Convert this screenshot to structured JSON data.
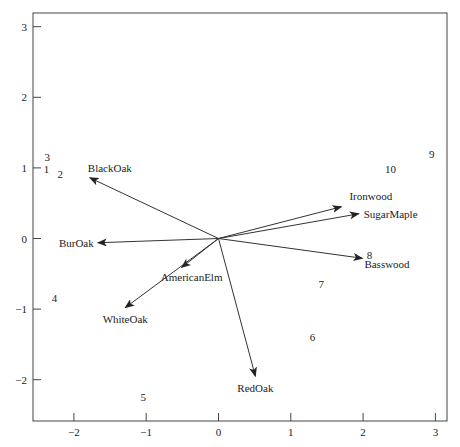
{
  "chart_data": {
    "type": "scatter",
    "subtype": "biplot",
    "title": "",
    "xlabel": "",
    "ylabel": "",
    "xlim": [
      -2.55,
      3.15
    ],
    "ylim": [
      -2.6,
      3.2
    ],
    "grid": false,
    "legend": null,
    "x_ticks": [
      -2,
      -1,
      0,
      1,
      2,
      3
    ],
    "y_ticks": [
      -2,
      -1,
      0,
      1,
      2,
      3
    ],
    "x_tick_labels": [
      "−2",
      "−1",
      "0",
      "1",
      "2",
      "3"
    ],
    "y_tick_labels": [
      "−2",
      "−1",
      "0",
      "1",
      "2",
      "3"
    ],
    "points": [
      {
        "label": "1",
        "x": -2.38,
        "y": 0.98
      },
      {
        "label": "2",
        "x": -2.19,
        "y": 0.92
      },
      {
        "label": "3",
        "x": -2.37,
        "y": 1.15
      },
      {
        "label": "4",
        "x": -2.27,
        "y": -0.84
      },
      {
        "label": "5",
        "x": -1.04,
        "y": -2.25
      },
      {
        "label": "6",
        "x": 1.3,
        "y": -1.39
      },
      {
        "label": "7",
        "x": 1.42,
        "y": -0.65
      },
      {
        "label": "8",
        "x": 2.09,
        "y": -0.23
      },
      {
        "label": "9",
        "x": 2.95,
        "y": 1.2
      },
      {
        "label": "10",
        "x": 2.38,
        "y": 0.98
      }
    ],
    "vectors": [
      {
        "label": "BlackOak",
        "x": -1.78,
        "y": 0.86,
        "label_dx": -2,
        "label_dy": -6,
        "anchor": "start"
      },
      {
        "label": "BurOak",
        "x": -1.67,
        "y": -0.06,
        "label_dx": -4,
        "label_dy": 4,
        "anchor": "end"
      },
      {
        "label": "AmericanElm",
        "x": -0.51,
        "y": -0.41,
        "label_dx": 10,
        "label_dy": 14,
        "anchor": "middle"
      },
      {
        "label": "WhiteOak",
        "x": -1.29,
        "y": -0.98,
        "label_dx": 0,
        "label_dy": 15,
        "anchor": "middle"
      },
      {
        "label": "RedOak",
        "x": 0.51,
        "y": -1.95,
        "label_dx": 0,
        "label_dy": 16,
        "anchor": "middle"
      },
      {
        "label": "Ironwood",
        "x": 1.7,
        "y": 0.45,
        "label_dx": 8,
        "label_dy": -7,
        "anchor": "start"
      },
      {
        "label": "SugarMaple",
        "x": 1.94,
        "y": 0.35,
        "label_dx": 5,
        "label_dy": 4,
        "anchor": "start"
      },
      {
        "label": "Basswood",
        "x": 1.99,
        "y": -0.28,
        "label_dx": 2,
        "label_dy": 10,
        "anchor": "start"
      }
    ]
  }
}
